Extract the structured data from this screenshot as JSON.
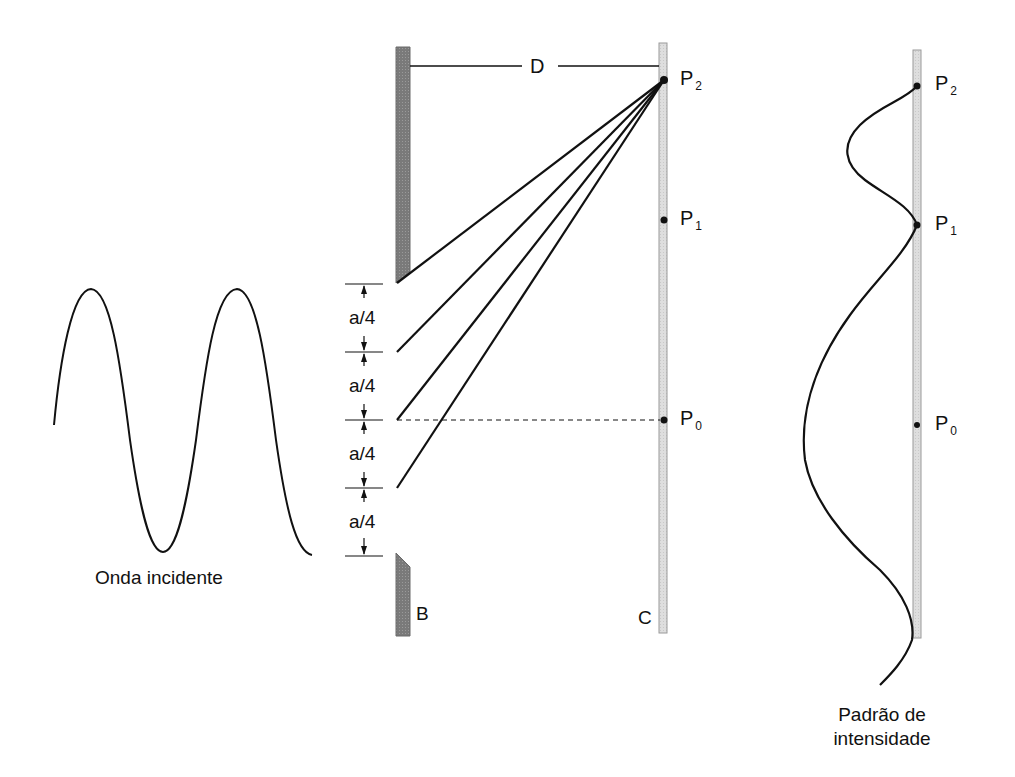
{
  "labels": {
    "distance": "D",
    "barrier": "B",
    "screen": "C",
    "slit_segment": "a/4",
    "points": [
      {
        "main": "P",
        "sub": "2"
      },
      {
        "main": "P",
        "sub": "1"
      },
      {
        "main": "P",
        "sub": "0"
      }
    ],
    "incident_wave": "Onda incidente",
    "intensity_line1": "Padrão de",
    "intensity_line2": "intensidade"
  },
  "colors": {
    "ink": "#111111",
    "barrier_fill": "#7a7a7a",
    "screen_fill": "#dcdcdc",
    "screen_stroke": "#9a9a9a"
  }
}
